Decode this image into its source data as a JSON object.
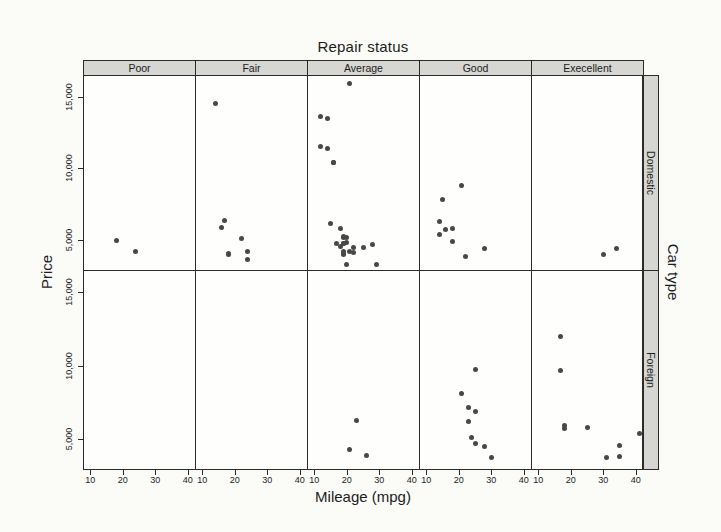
{
  "title": "Repair status",
  "row_axis_title": "Car type",
  "x_axis": {
    "label": "Mileage (mpg)",
    "ticks": [
      10,
      20,
      30,
      40
    ],
    "tick_labels": [
      "10",
      "20",
      "30",
      "40"
    ],
    "range": [
      7.8,
      42.2
    ]
  },
  "y_axis": {
    "label": "Price",
    "ticks": [
      5000,
      10000,
      15000
    ],
    "tick_labels": [
      "5,000",
      "10,000",
      "15,000"
    ],
    "range": [
      2900,
      16500
    ]
  },
  "columns": [
    "Poor",
    "Fair",
    "Average",
    "Good",
    "Execellent"
  ],
  "rows": [
    "Domestic",
    "Foreign"
  ],
  "colors": {
    "strip_background": "#d6d6d2",
    "panel_background": "#fefefc",
    "border": "#2b2b2b",
    "point": "#484848",
    "page_background": "#fbfbf8"
  },
  "chart_data": {
    "type": "scatter",
    "title": "Repair status",
    "xlabel": "Mileage (mpg)",
    "ylabel": "Price",
    "facet_column_title": "Repair status",
    "facet_row_title": "Car type",
    "xlim": [
      7.8,
      42.2
    ],
    "ylim": [
      2900,
      16500
    ],
    "grid": false,
    "facets": [
      {
        "column": "Poor",
        "row": "Domestic",
        "points": [
          [
            18,
            4934
          ],
          [
            24,
            4195
          ]
        ]
      },
      {
        "column": "Fair",
        "row": "Domestic",
        "points": [
          [
            14,
            14500
          ],
          [
            16,
            5886
          ],
          [
            17,
            6342
          ],
          [
            18,
            4010
          ],
          [
            18,
            4060
          ],
          [
            22,
            5104
          ],
          [
            24,
            3667
          ],
          [
            24,
            4172
          ]
        ]
      },
      {
        "column": "Average",
        "row": "Domestic",
        "points": [
          [
            12,
            11497
          ],
          [
            12,
            13594
          ],
          [
            14,
            11385
          ],
          [
            14,
            13466
          ],
          [
            15,
            6165
          ],
          [
            16,
            10371
          ],
          [
            16,
            10372
          ],
          [
            17,
            4749
          ],
          [
            18,
            4516
          ],
          [
            18,
            5788
          ],
          [
            19,
            3955
          ],
          [
            19,
            4082
          ],
          [
            19,
            4181
          ],
          [
            19,
            4723
          ],
          [
            19,
            4733
          ],
          [
            19,
            5172
          ],
          [
            19,
            5222
          ],
          [
            20,
            3291
          ],
          [
            20,
            4816
          ],
          [
            20,
            5189
          ],
          [
            21,
            4187
          ],
          [
            21,
            15906
          ],
          [
            22,
            4099
          ],
          [
            22,
            4504
          ],
          [
            25,
            4482
          ],
          [
            28,
            4647
          ],
          [
            29,
            3299
          ]
        ]
      },
      {
        "column": "Good",
        "row": "Domestic",
        "points": [
          [
            14,
            5379
          ],
          [
            14,
            6303
          ],
          [
            15,
            7827
          ],
          [
            16,
            5705
          ],
          [
            18,
            4890
          ],
          [
            18,
            5798
          ],
          [
            21,
            8814
          ],
          [
            22,
            3829
          ],
          [
            28,
            4389
          ]
        ]
      },
      {
        "column": "Execellent",
        "row": "Domestic",
        "points": [
          [
            30,
            3984
          ],
          [
            34,
            4425
          ]
        ]
      },
      {
        "column": "Poor",
        "row": "Foreign",
        "points": []
      },
      {
        "column": "Fair",
        "row": "Foreign",
        "points": []
      },
      {
        "column": "Average",
        "row": "Foreign",
        "points": [
          [
            21,
            4296
          ],
          [
            23,
            6295
          ],
          [
            26,
            3895
          ]
        ]
      },
      {
        "column": "Good",
        "row": "Foreign",
        "points": [
          [
            21,
            8129
          ],
          [
            23,
            6229
          ],
          [
            23,
            7140
          ],
          [
            24,
            5079
          ],
          [
            25,
            4697
          ],
          [
            25,
            6850
          ],
          [
            25,
            9735
          ],
          [
            28,
            4499
          ],
          [
            30,
            3780
          ]
        ]
      },
      {
        "column": "Execellent",
        "row": "Foreign",
        "points": [
          [
            17,
            9690
          ],
          [
            17,
            11995
          ],
          [
            18,
            5719
          ],
          [
            18,
            5899
          ],
          [
            25,
            5799
          ],
          [
            31,
            3748
          ],
          [
            35,
            3798
          ],
          [
            35,
            4589
          ],
          [
            41,
            5397
          ]
        ]
      }
    ]
  }
}
